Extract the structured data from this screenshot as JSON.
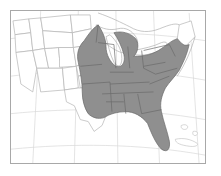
{
  "figure": {
    "type": "map",
    "title": "",
    "projection": "conic",
    "background_color": "#ffffff",
    "frame_color": "#a8a8a8",
    "shaded_fill_color": "#8f8f8f",
    "shaded_border_color": "#6a6a6a",
    "unshaded_fill_color": "#ffffff",
    "unshaded_border_color": "#b4b4b4",
    "graticule_color": "#d8d8d8",
    "graticule_visible": true
  },
  "legend": {
    "visible": false,
    "entries": [
      {
        "label": "Present",
        "color": "#8f8f8f"
      },
      {
        "label": "Absent",
        "color": "#ffffff"
      }
    ]
  },
  "regions": {
    "shaded_label": "Range (shaded)",
    "unshaded_label": "Outside range",
    "shaded_states": [
      "Minnesota (east)",
      "Wisconsin",
      "Michigan",
      "Iowa (east)",
      "Illinois",
      "Indiana",
      "Ohio",
      "Missouri",
      "Arkansas",
      "Louisiana",
      "Mississippi",
      "Alabama",
      "Tennessee",
      "Kentucky",
      "Georgia",
      "Florida",
      "South Carolina",
      "North Carolina",
      "Virginia",
      "West Virginia",
      "Maryland",
      "Delaware",
      "Pennsylvania",
      "New Jersey",
      "New York",
      "Connecticut",
      "Rhode Island",
      "Massachusetts",
      "Vermont",
      "New Hampshire",
      "Oklahoma (east)",
      "Kansas (east)"
    ],
    "unshaded_states": [
      "Washington",
      "Oregon",
      "California",
      "Idaho",
      "Nevada",
      "Utah",
      "Arizona",
      "Montana",
      "Wyoming",
      "Colorado",
      "New Mexico",
      "North Dakota",
      "South Dakota",
      "Nebraska",
      "Texas",
      "Maine"
    ]
  },
  "annotations": {
    "scale_bar": "",
    "north_arrow": "",
    "caption": ""
  }
}
